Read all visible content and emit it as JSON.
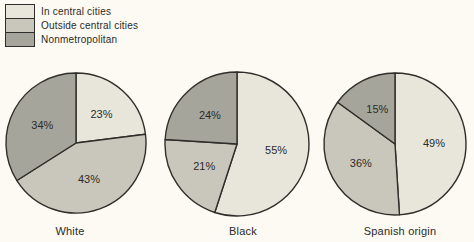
{
  "legend": {
    "items": [
      {
        "label": "In central cities",
        "color": "#e8e6db"
      },
      {
        "label": "Outside central cities",
        "color": "#c9c7bc"
      },
      {
        "label": "Nonmetropolitan",
        "color": "#a6a59b"
      }
    ]
  },
  "chart_data": {
    "type": "pie",
    "categories": [
      "In central cities",
      "Outside central cities",
      "Nonmetropolitan"
    ],
    "colors": [
      "#e8e6db",
      "#c9c7bc",
      "#a6a59b"
    ],
    "stroke_color": "#2f2e2a",
    "start_angle_deg": 0,
    "direction": "clockwise",
    "value_format": "percent",
    "legend_position": "top-left",
    "series": [
      {
        "name": "White",
        "values": [
          23,
          43,
          34
        ]
      },
      {
        "name": "Black",
        "values": [
          55,
          21,
          24
        ]
      },
      {
        "name": "Spanish origin",
        "values": [
          49,
          36,
          15
        ]
      }
    ]
  }
}
